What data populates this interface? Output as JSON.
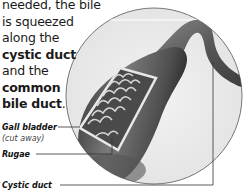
{
  "text": {
    "line1": "needed, the bile",
    "line2": "is squeezed",
    "line3": "along the",
    "term1": "cystic duct",
    "line5": "and the",
    "term2a": "common",
    "term2b": "bile duct",
    "period": "."
  },
  "labels": {
    "gall_bladder": "Gall bladder",
    "gall_bladder_note": "(cut away)",
    "rugae": "Rugae",
    "cystic_duct": "Cystic duct"
  },
  "colors": {
    "organ_dark": "#3a3a3a",
    "organ_mid": "#6e6e6e",
    "circle_bg": "#ececec",
    "circle_stroke": "#555555",
    "leader_line": "#333333"
  }
}
